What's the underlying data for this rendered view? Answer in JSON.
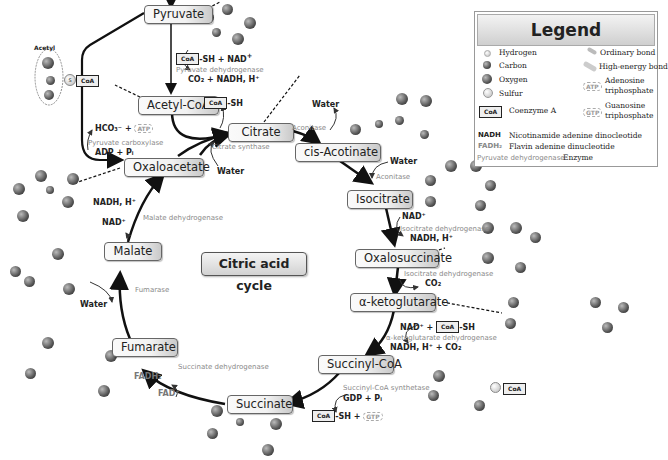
{
  "diagram": {
    "title": "Citric acid cycle",
    "nodes": {
      "pyruvate": "Pyruvate",
      "acetyl_coa": "Acetyl-CoA",
      "citrate": "Citrate",
      "cis_aconitate": "cis-Acotinate",
      "isocitrate": "Isocitrate",
      "oxalosuccinate": "Oxalosuccinate",
      "alpha_ketoglutarate": "α-ketoglutarate",
      "succinyl_coa": "Succinyl-CoA",
      "succinate": "Succinate",
      "fumarate": "Fumarate",
      "malate": "Malate",
      "oxaloacetate": "Oxaloacetate"
    },
    "enzymes": {
      "pyruvate_dehydrogenase": "Pyruvate dehydrogenase",
      "pyruvate_carboxylase": "Pyruvate carboxylase",
      "citrate_synthase": "Citrate synthase",
      "aconitase_1": "Aconitase",
      "aconitase_2": "Aconitase",
      "isocitrate_dehydrogenase_1": "Isocitrate dehydrogenase",
      "isocitrate_dehydrogenase_2": "Isocitrate dehydrogenase",
      "akg_dehydrogenase": "α-ketoglutarate dehydrogenase",
      "succinyl_coa_synthetase": "Succinyl-CoA synthetase",
      "succinate_dehydrogenase": "Succinate dehydrogenase",
      "fumarase": "Fumarase",
      "malate_dehydrogenase": "Malate dehydrogenase"
    },
    "cofactors": {
      "acetyl_label": "Acetyl",
      "coa": "CoA",
      "sh": "-SH",
      "sh_nad": "-SH + NAD",
      "co2_nadh": "CO₂ + NADH, H⁺",
      "hco3_atp": "HCO₃⁻ +",
      "atp": "ATP",
      "adp_pi": "ADP + Pᵢ",
      "water": "Water",
      "nad": "NAD⁺",
      "nadh_h": "NADH, H⁺",
      "co2": "CO₂",
      "nad_plus": "NAD⁺ +",
      "nadh_h_co2": "NADH, H⁺ + CO₂",
      "gdp_pi": "GDP + Pᵢ",
      "sh_plus": "-SH +",
      "gtp": "GTP",
      "fadh2": "FADH₂",
      "fad": "FAD⁺",
      "sulfur_s": "S"
    }
  },
  "legend": {
    "title": "Legend",
    "items": {
      "hydrogen": "Hydrogen",
      "carbon": "Carbon",
      "oxygen": "Oxygen",
      "sulfur": "Sulfur",
      "coenzyme_a": "Coenzyme A",
      "ordinary_bond": "Ordinary bond",
      "high_energy_bond": "High-energy bond",
      "atp_line1": "Adenosine",
      "atp_line2": "triphosphate",
      "gtp_line1": "Guanosine",
      "gtp_line2": "triphosphate",
      "nadh_abbr": "NADH",
      "nadh_desc": "Nicotinamide adenine dinocleotide",
      "fadh_abbr": "FADH₂",
      "fadh_desc": "Flavin adenine dinucleotide",
      "enzyme_example": "Pyruvate dehydrogenase",
      "enzyme_desc": "Enzyme",
      "coa_badge": "CoA",
      "atp_badge": "ATP",
      "gtp_badge": "GTP"
    }
  }
}
